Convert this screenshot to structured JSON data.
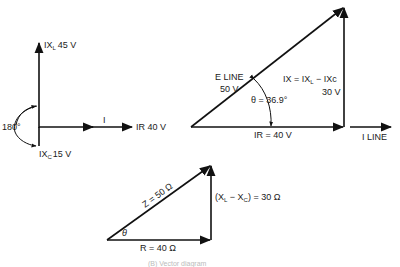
{
  "phasor_diagram": {
    "ixl_label": "IX",
    "ixl_sub": "L",
    "ixl_value": "45 V",
    "ir_label": "IR 40 V",
    "current_label": "I",
    "ixc_label": "IX",
    "ixc_sub": "C",
    "ixc_value": "15 V",
    "angle_label": "180°"
  },
  "voltage_triangle": {
    "e_line_label": "E LINE",
    "e_line_value": "50 V",
    "theta_label": "θ = 36.9°",
    "ix_eq_prefix": "IX = IX",
    "ix_eq_sub": "L",
    "ix_eq_suffix": " − IXc",
    "ix_value": "30 V",
    "ir_label": "IR = 40 V",
    "i_line_label": "I LINE"
  },
  "impedance_triangle": {
    "z_label": "Z = 50 Ω",
    "theta_label": "θ",
    "r_label": "R = 40 Ω",
    "x_prefix": "(X",
    "x_sub1": "L",
    "x_mid": " − X",
    "x_sub2": "C",
    "x_suffix": ") = 30 Ω"
  },
  "caption": "(B) Vector diagram"
}
